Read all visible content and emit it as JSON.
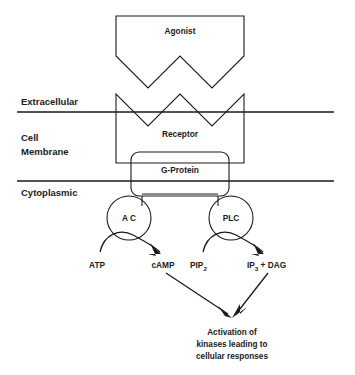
{
  "diagram": {
    "title_present": false,
    "colors": {
      "stroke": "#1a1a1a",
      "background": "#ffffff"
    },
    "side_labels": [
      {
        "id": "extracellular",
        "text": "Extracellular"
      },
      {
        "id": "cell-membrane-line1",
        "text": "Cell"
      },
      {
        "id": "cell-membrane-line2",
        "text": "Membrane"
      },
      {
        "id": "cytoplasmic",
        "text": "Cytoplasmic"
      }
    ],
    "shapes": [
      {
        "id": "agonist",
        "label": "Agonist",
        "type": "zigzag-bottom-box"
      },
      {
        "id": "receptor",
        "label": "Receptor",
        "type": "zigzag-top-box"
      },
      {
        "id": "g-protein",
        "label": "G-Protein",
        "type": "rounded-box"
      }
    ],
    "enzymes": [
      {
        "id": "adenylate-cyclase",
        "label": "A C"
      },
      {
        "id": "phospholipase-c",
        "label": "PLC"
      }
    ],
    "reactions": [
      {
        "id": "ac-reaction",
        "substrate": {
          "text": "ATP",
          "subscript": ""
        },
        "product": {
          "text": "cAMP",
          "subscript": ""
        }
      },
      {
        "id": "plc-reaction",
        "substrate": {
          "text": "PIP",
          "subscript": "2"
        },
        "product": {
          "text": "IP",
          "subscript": "3",
          "suffix": " + DAG"
        }
      }
    ],
    "outcome": {
      "id": "outcome-text",
      "lines": [
        "Activation of",
        "kinases leading to",
        "cellular responses"
      ]
    }
  }
}
